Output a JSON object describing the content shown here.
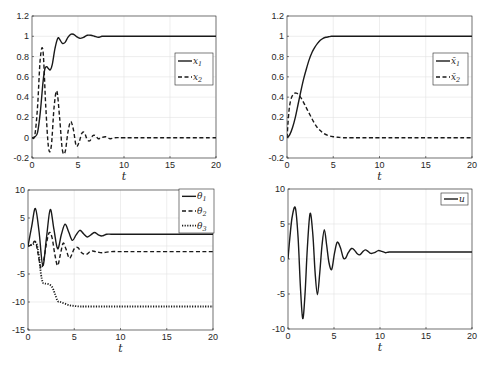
{
  "chart_data": [
    {
      "id": "top-left",
      "type": "line",
      "title": "",
      "xlabel": "t",
      "ylabel": "",
      "xlim": [
        0,
        20
      ],
      "ylim": [
        -0.2,
        1.2
      ],
      "xticks": [
        0,
        5,
        10,
        15,
        20
      ],
      "yticks": [
        -0.2,
        0,
        0.2,
        0.4,
        0.6,
        0.8,
        1,
        1.2
      ],
      "ytick_labels": [
        "-0.2",
        "0",
        "0.2",
        "0.4",
        "0.6",
        "0.8",
        "1",
        "1.2"
      ],
      "grid": true,
      "legend_position": "right-center",
      "box": [
        32,
        16,
        216,
        158
      ],
      "legend_box": [
        175,
        53,
        213,
        85
      ],
      "series": [
        {
          "name": "x",
          "sub": "1",
          "style": "solid",
          "x": [
            0,
            0.3,
            0.6,
            0.9,
            1.2,
            1.4,
            1.6,
            1.8,
            2.0,
            2.2,
            2.5,
            2.8,
            3.0,
            3.3,
            3.6,
            3.9,
            4.2,
            4.5,
            4.8,
            5.2,
            5.6,
            6.0,
            6.4,
            6.8,
            7.2,
            7.6,
            8,
            9,
            10,
            12,
            15,
            20
          ],
          "y": [
            0,
            0.01,
            0.05,
            0.25,
            0.55,
            0.68,
            0.7,
            0.68,
            0.67,
            0.72,
            0.88,
            0.98,
            0.97,
            0.93,
            0.94,
            0.99,
            1.02,
            1.02,
            1.0,
            0.98,
            0.99,
            1.01,
            1.01,
            1.0,
            0.99,
            1.0,
            1.0,
            1.0,
            1.0,
            1.0,
            1.0,
            1.0
          ]
        },
        {
          "name": "x",
          "sub": "2",
          "style": "dashed",
          "x": [
            0,
            0.3,
            0.6,
            0.9,
            1.2,
            1.5,
            1.8,
            2.1,
            2.4,
            2.7,
            3.0,
            3.3,
            3.6,
            3.9,
            4.2,
            4.5,
            4.8,
            5.1,
            5.4,
            5.7,
            6.0,
            6.3,
            6.6,
            6.9,
            7.2,
            7.5,
            8,
            8.5,
            9,
            10,
            12,
            20
          ],
          "y": [
            0,
            0.02,
            0.3,
            0.78,
            0.85,
            0.3,
            -0.1,
            -0.08,
            0.3,
            0.46,
            0.2,
            -0.12,
            -0.14,
            0.05,
            0.16,
            0.08,
            -0.08,
            -0.05,
            0.04,
            0.05,
            -0.02,
            -0.03,
            0.02,
            0.02,
            -0.01,
            0,
            0.01,
            -0.01,
            0,
            0,
            0,
            0
          ]
        }
      ]
    },
    {
      "id": "top-right",
      "type": "line",
      "title": "",
      "xlabel": "t",
      "ylabel": "",
      "xlim": [
        0,
        20
      ],
      "ylim": [
        -0.2,
        1.2
      ],
      "xticks": [
        0,
        5,
        10,
        15,
        20
      ],
      "yticks": [
        -0.2,
        0,
        0.2,
        0.4,
        0.6,
        0.8,
        1,
        1.2
      ],
      "ytick_labels": [
        "-0.2",
        "0",
        "0.2",
        "0.4",
        "0.6",
        "0.8",
        "1",
        "1.2"
      ],
      "grid": true,
      "legend_position": "right-center",
      "box": [
        287,
        16,
        472,
        158
      ],
      "legend_box": [
        433,
        53,
        468,
        85
      ],
      "series": [
        {
          "name": "x̄",
          "sub": "1",
          "style": "solid",
          "x": [
            0,
            0.3,
            0.6,
            0.9,
            1.2,
            1.5,
            1.8,
            2.1,
            2.4,
            2.7,
            3.0,
            3.3,
            3.6,
            3.9,
            4.2,
            4.5,
            4.8,
            5.2,
            5.6,
            6,
            7,
            10,
            20
          ],
          "y": [
            0,
            0.03,
            0.1,
            0.2,
            0.33,
            0.46,
            0.58,
            0.68,
            0.77,
            0.84,
            0.89,
            0.93,
            0.96,
            0.98,
            0.99,
            0.995,
            1.0,
            1.0,
            1.0,
            1.0,
            1.0,
            1.0,
            1.0
          ]
        },
        {
          "name": "x̄",
          "sub": "2",
          "style": "dashed",
          "x": [
            0,
            0.2,
            0.4,
            0.7,
            1.0,
            1.3,
            1.6,
            2.0,
            2.4,
            2.8,
            3.2,
            3.6,
            4.0,
            4.5,
            5.0,
            5.5,
            6,
            7,
            10,
            20
          ],
          "y": [
            0,
            0.25,
            0.37,
            0.43,
            0.44,
            0.42,
            0.38,
            0.31,
            0.24,
            0.17,
            0.11,
            0.07,
            0.04,
            0.02,
            0.01,
            0.005,
            0,
            0,
            0,
            0
          ]
        }
      ]
    },
    {
      "id": "bottom-left",
      "type": "line",
      "title": "",
      "xlabel": "t",
      "ylabel": "",
      "xlim": [
        0,
        20
      ],
      "ylim": [
        -15,
        10
      ],
      "xticks": [
        0,
        5,
        10,
        15,
        20
      ],
      "yticks": [
        -15,
        -10,
        -5,
        0,
        5,
        10
      ],
      "ytick_labels": [
        "-15",
        "-10",
        "-5",
        "0",
        "5",
        "10"
      ],
      "grid": true,
      "legend_position": "top-right",
      "box": [
        28,
        190,
        213,
        330
      ],
      "legend_box": [
        179,
        189,
        214,
        233
      ],
      "series": [
        {
          "name": "θ",
          "sub": "1",
          "style": "solid",
          "x": [
            0,
            0.4,
            0.8,
            1.2,
            1.6,
            2.0,
            2.4,
            2.8,
            3.2,
            3.6,
            4.0,
            4.4,
            4.8,
            5.2,
            5.6,
            6.0,
            6.4,
            6.8,
            7.2,
            7.6,
            8.0,
            8.5,
            9,
            10,
            12,
            15,
            20
          ],
          "y": [
            0,
            3.5,
            6.7,
            2.5,
            -3.5,
            1.5,
            6.5,
            3.0,
            -0.5,
            2.0,
            3.9,
            2.5,
            1.0,
            2.0,
            2.8,
            2.2,
            1.6,
            2.0,
            2.4,
            2.0,
            1.8,
            2.1,
            2.1,
            2.1,
            2.1,
            2.1,
            2.1
          ]
        },
        {
          "name": "θ",
          "sub": "2",
          "style": "dashed",
          "x": [
            0,
            0.4,
            0.8,
            1.1,
            1.4,
            1.7,
            2.0,
            2.3,
            2.6,
            2.9,
            3.2,
            3.5,
            3.8,
            4.1,
            4.5,
            5.0,
            5.4,
            5.8,
            6.3,
            6.8,
            7.3,
            8,
            9,
            10,
            12,
            15,
            20
          ],
          "y": [
            0,
            0.2,
            0.8,
            -1.5,
            -4.0,
            -2.5,
            0.5,
            2.4,
            1.5,
            -1.5,
            -3.5,
            -1.5,
            0.5,
            -0.5,
            -2.2,
            -0.5,
            -0.3,
            -1.2,
            -1.5,
            -0.9,
            -1.0,
            -1.2,
            -1.0,
            -1.0,
            -1.0,
            -1.0,
            -1.0
          ]
        },
        {
          "name": "θ",
          "sub": "3",
          "style": "dotted",
          "x": [
            0,
            0.5,
            0.9,
            1.2,
            1.4,
            1.6,
            1.8,
            2.2,
            2.6,
            2.9,
            3.2,
            3.5,
            4.0,
            4.5,
            5.0,
            5.5,
            6,
            8,
            10,
            15,
            20
          ],
          "y": [
            0,
            0.3,
            0.5,
            -2,
            -5,
            -6.5,
            -6.7,
            -6.8,
            -7.3,
            -8.5,
            -9.8,
            -10.0,
            -10.3,
            -10.6,
            -10.7,
            -10.8,
            -10.8,
            -10.8,
            -10.8,
            -10.8,
            -10.8
          ]
        }
      ]
    },
    {
      "id": "bottom-right",
      "type": "line",
      "title": "",
      "xlabel": "t",
      "ylabel": "",
      "xlim": [
        0,
        20
      ],
      "ylim": [
        -10,
        10
      ],
      "xticks": [
        0,
        5,
        10,
        15,
        20
      ],
      "yticks": [
        -10,
        -5,
        0,
        5,
        10
      ],
      "ytick_labels": [
        "-10",
        "-5",
        "0",
        "5",
        "10"
      ],
      "grid": true,
      "legend_position": "top-right",
      "box": [
        288,
        189,
        472,
        329
      ],
      "legend_box": [
        441,
        193,
        468,
        205
      ],
      "series": [
        {
          "name": "u",
          "sub": "",
          "style": "solid",
          "x": [
            0,
            0.2,
            0.45,
            0.8,
            1.1,
            1.35,
            1.6,
            1.85,
            2.1,
            2.4,
            2.7,
            2.95,
            3.2,
            3.45,
            3.7,
            3.95,
            4.2,
            4.45,
            4.75,
            5.05,
            5.35,
            5.7,
            6.0,
            6.25,
            6.55,
            6.9,
            7.2,
            7.5,
            7.8,
            8.1,
            8.4,
            8.7,
            9.0,
            9.4,
            9.8,
            10.2,
            10.6,
            11,
            12,
            14,
            16,
            20
          ],
          "y": [
            0,
            3.0,
            6.0,
            7.3,
            3.0,
            -4.0,
            -8.5,
            -5.0,
            1.5,
            6.5,
            3.5,
            -2.0,
            -5.1,
            -2.0,
            2.0,
            4.2,
            2.0,
            -0.5,
            -1.5,
            0.8,
            2.4,
            1.6,
            0.2,
            0.1,
            0.9,
            1.5,
            1.3,
            0.8,
            0.6,
            1.0,
            1.3,
            1.1,
            0.8,
            0.9,
            1.2,
            1.1,
            0.9,
            1.0,
            1.0,
            1.0,
            1.0,
            1.0
          ]
        }
      ]
    }
  ]
}
